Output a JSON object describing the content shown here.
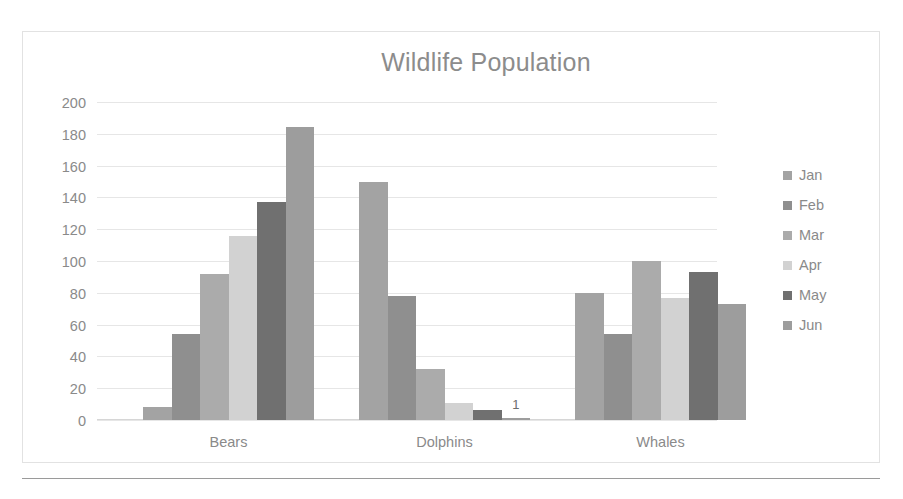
{
  "chart_data": {
    "type": "bar",
    "title": "Wildlife Population",
    "xlabel": "",
    "ylabel": "",
    "categories": [
      "Bears",
      "Dolphins",
      "Whales"
    ],
    "series": [
      {
        "name": "Jan",
        "color": "#a3a3a3",
        "values": [
          8,
          150,
          80
        ]
      },
      {
        "name": "Feb",
        "color": "#8f8f8f",
        "values": [
          54,
          78,
          54
        ]
      },
      {
        "name": "Mar",
        "color": "#ababab",
        "values": [
          92,
          32,
          100
        ]
      },
      {
        "name": "Apr",
        "color": "#d2d2d2",
        "values": [
          116,
          11,
          77
        ]
      },
      {
        "name": "May",
        "color": "#707070",
        "values": [
          137,
          6,
          93
        ]
      },
      {
        "name": "Jun",
        "color": "#9d9d9d",
        "values": [
          184,
          1,
          73
        ]
      }
    ],
    "ylim": [
      0,
      200
    ],
    "yticks": [
      "200",
      "180",
      "160",
      "140",
      "120",
      "100",
      "80",
      "60",
      "40",
      "20",
      "0"
    ],
    "grid": true,
    "legend_position": "right",
    "data_labels": [
      {
        "category": "Dolphins",
        "series": "Jun",
        "text": "1"
      }
    ]
  }
}
